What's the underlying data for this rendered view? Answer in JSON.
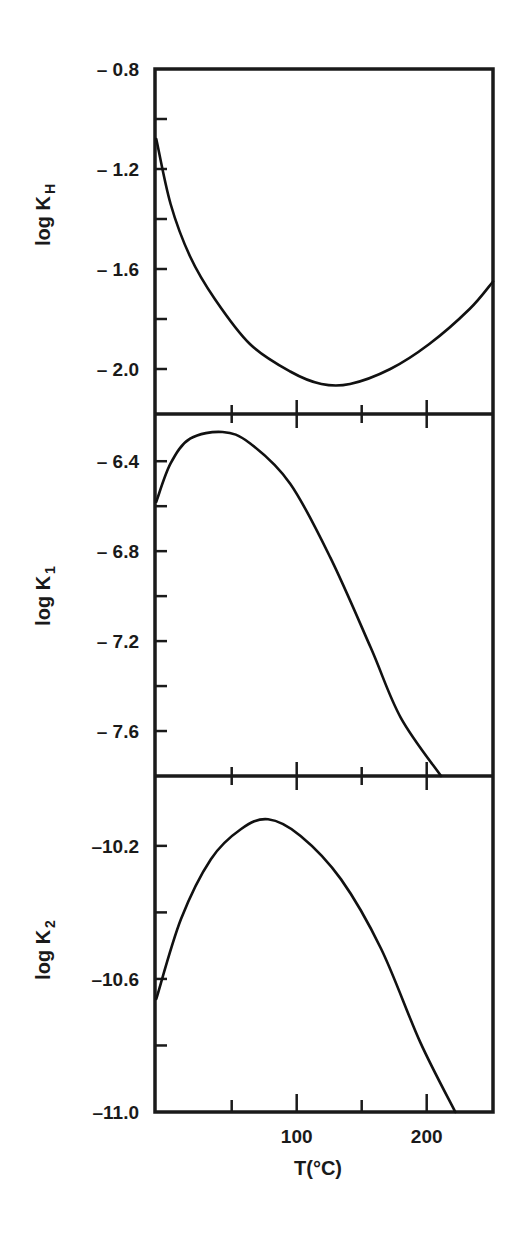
{
  "chart_data": {
    "type": "line",
    "layout": "three vertically stacked panels sharing x-axis",
    "grid": false,
    "legend": null,
    "xlabel": "T(°C)",
    "xlim": [
      -9,
      251
    ],
    "x_ticks_major": [
      100,
      200
    ],
    "x_ticks_minor": [
      50,
      150
    ],
    "x_tick_labels": [
      "100",
      "200"
    ],
    "panels": [
      {
        "id": "KH",
        "ylabel": "log K",
        "ylabel_sub": "H",
        "ylim": [
          -2.18,
          -0.8
        ],
        "y_ticks": [
          -0.8,
          -1.0,
          -1.2,
          -1.4,
          -1.6,
          -1.8,
          -2.0
        ],
        "y_tick_labels": [
          "– 0.8",
          "– 1.2",
          "– 1.6",
          "– 2.0"
        ],
        "y_tick_label_values": [
          -0.8,
          -1.2,
          -1.6,
          -2.0
        ],
        "series": [
          {
            "name": "log KH",
            "x": [
              -8,
              3,
              18,
              37,
              64,
              95,
              119,
              141,
              172,
              202,
              233,
              251
            ],
            "y": [
              -1.08,
              -1.34,
              -1.55,
              -1.72,
              -1.9,
              -2.01,
              -2.06,
              -2.06,
              -2.0,
              -1.9,
              -1.76,
              -1.65
            ]
          }
        ]
      },
      {
        "id": "K1",
        "ylabel": "log K",
        "ylabel_sub": "1",
        "ylim": [
          -7.8,
          -6.19
        ],
        "y_ticks": [
          -6.4,
          -6.6,
          -6.8,
          -7.0,
          -7.2,
          -7.4,
          -7.6
        ],
        "y_tick_labels": [
          "– 6.4",
          "– 6.8",
          "– 7.2",
          "– 7.6"
        ],
        "y_tick_label_values": [
          -6.4,
          -6.8,
          -7.2,
          -7.6
        ],
        "series": [
          {
            "name": "log K1",
            "x": [
              -8,
              3,
              18,
              43,
              64,
              95,
              126,
              157,
              180,
              211
            ],
            "y": [
              -6.58,
              -6.41,
              -6.3,
              -6.27,
              -6.32,
              -6.5,
              -6.83,
              -7.23,
              -7.54,
              -7.8
            ]
          }
        ]
      },
      {
        "id": "K2",
        "ylabel": "log K",
        "ylabel_sub": "2",
        "ylim": [
          -11.0,
          -9.99
        ],
        "y_ticks": [
          -10.2,
          -10.4,
          -10.6,
          -10.8,
          -11.0
        ],
        "y_tick_labels": [
          "– 10.2",
          "– 10.6",
          "– 11.0"
        ],
        "y_tick_label_values": [
          -10.2,
          -10.6,
          -11.0
        ],
        "series": [
          {
            "name": "log K2",
            "x": [
              -8,
              11,
              34,
              57,
              78,
              103,
              134,
              165,
              195,
              222
            ],
            "y": [
              -10.66,
              -10.42,
              -10.24,
              -10.15,
              -10.12,
              -10.17,
              -10.3,
              -10.51,
              -10.79,
              -11.0
            ]
          }
        ]
      }
    ]
  },
  "labels": {
    "x_axis_title": "T(°C)",
    "panel_titles": [
      {
        "main": "log K",
        "sub": "H"
      },
      {
        "main": "log K",
        "sub": "1"
      },
      {
        "main": "log K",
        "sub": "2"
      }
    ],
    "y_tick_texts": {
      "KH": [
        "– 0.8",
        "– 1.2",
        "– 1.6",
        "– 2.0"
      ],
      "K1": [
        "– 6.4",
        "– 6.8",
        "– 7.2",
        "– 7.6"
      ],
      "K2": [
        "–10.2",
        "–10.6",
        "–11.0"
      ]
    },
    "x_tick_texts": [
      "100",
      "200"
    ]
  }
}
